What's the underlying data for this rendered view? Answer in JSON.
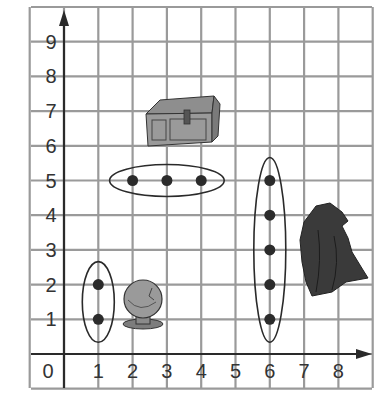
{
  "chart_data": {
    "type": "scatter",
    "title": "",
    "xlabel": "",
    "ylabel": "",
    "xlim": [
      0,
      8
    ],
    "ylim": [
      0,
      9
    ],
    "grid": true,
    "x_ticks": [
      "0",
      "1",
      "2",
      "3",
      "4",
      "5",
      "6",
      "7",
      "8"
    ],
    "y_ticks": [
      "1",
      "2",
      "3",
      "4",
      "5",
      "6",
      "7",
      "8",
      "9"
    ],
    "series": [
      {
        "name": "group-x1",
        "points": [
          [
            1,
            1
          ],
          [
            1,
            2
          ]
        ]
      },
      {
        "name": "group-y5",
        "points": [
          [
            2,
            5
          ],
          [
            3,
            5
          ],
          [
            4,
            5
          ]
        ]
      },
      {
        "name": "group-x6",
        "points": [
          [
            6,
            1
          ],
          [
            6,
            2
          ],
          [
            6,
            3
          ],
          [
            6,
            4
          ],
          [
            6,
            5
          ]
        ]
      }
    ],
    "pictures": [
      {
        "name": "crystal-ball",
        "near": [
          2.2,
          1.4
        ]
      },
      {
        "name": "treasure-chest",
        "near": [
          3.3,
          6.7
        ]
      },
      {
        "name": "cloaked-figure",
        "near": [
          7.5,
          3.2
        ]
      }
    ]
  },
  "labels": {
    "origin": "0",
    "x": [
      "1",
      "2",
      "3",
      "4",
      "5",
      "6",
      "7",
      "8"
    ],
    "y": [
      "1",
      "2",
      "3",
      "4",
      "5",
      "6",
      "7",
      "8",
      "9"
    ]
  },
  "colors": {
    "grid": "#9a9a9a",
    "axis": "#2a2a2a",
    "point": "#2b2b2b",
    "picture": "#8a8a8a"
  }
}
